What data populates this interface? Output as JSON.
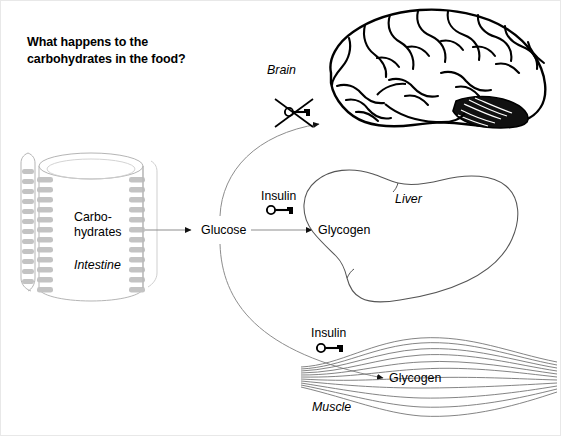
{
  "title": "What happens to the\ncarbohydrates in the food?",
  "title_line1": "What happens to the",
  "title_line2": "carbohydrates in the food?",
  "nodes": {
    "carbohydrates": "Carbo-\nhydrates",
    "carbohydrates_line1": "Carbo-",
    "carbohydrates_line2": "hydrates",
    "glucose": "Glucose",
    "glycogen_liver": "Glycogen",
    "glycogen_muscle": "Glycogen",
    "insulin_liver": "Insulin",
    "insulin_muscle": "Insulin"
  },
  "organs": {
    "intestine": "Intestine",
    "brain": "Brain",
    "liver": "Liver",
    "muscle": "Muscle"
  },
  "icons": {
    "key_liver": "key-icon",
    "key_muscle": "key-icon",
    "key_brain_crossed": "key-crossed-out-icon",
    "brain": "brain-illustration",
    "liver": "liver-illustration",
    "muscle": "muscle-illustration",
    "intestine": "intestine-illustration"
  },
  "arrows": [
    {
      "name": "intestine-to-glucose",
      "from": "Carbo-hydrates",
      "to": "Glucose"
    },
    {
      "name": "glucose-to-brain",
      "from": "Glucose",
      "to": "Brain"
    },
    {
      "name": "glucose-to-glycogen-liver",
      "from": "Glucose",
      "to": "Glycogen (Liver)"
    },
    {
      "name": "glucose-to-glycogen-muscle",
      "from": "Glucose",
      "to": "Glycogen (Muscle)"
    }
  ],
  "colors": {
    "background": "#ffffff",
    "text": "#000000",
    "line_gray": "#6e6e6e",
    "villi_gray": "#b9b9b9",
    "organ_outline": "#555555",
    "brain_ink": "#000000",
    "border": "#e8e8e8"
  }
}
